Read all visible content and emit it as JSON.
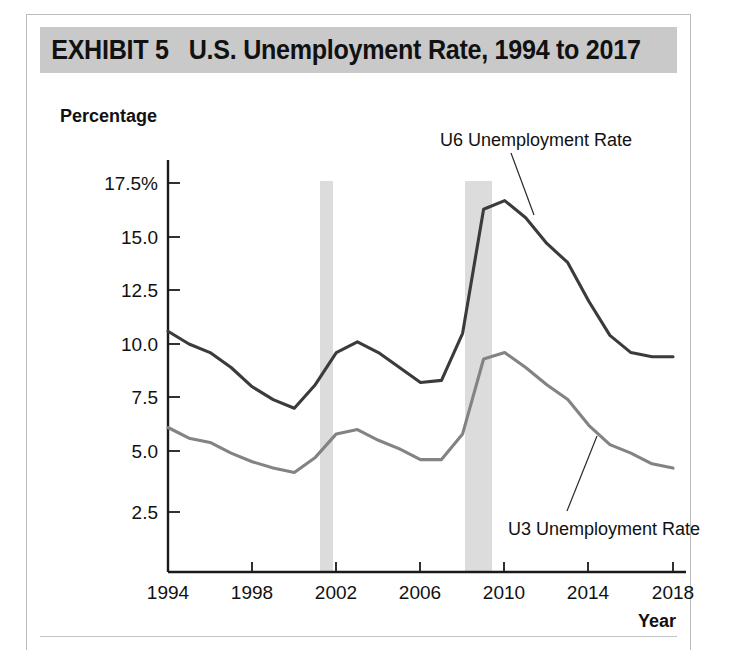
{
  "exhibit": {
    "title": "EXHIBIT 5   U.S. Unemployment Rate, 1994 to 2017",
    "title_bar_color": "#c9c9c9"
  },
  "chart_data": {
    "type": "line",
    "title": "U.S. Unemployment Rate, 1994 to 2017",
    "xlabel": "Year",
    "ylabel": "Percentage",
    "xlim": [
      1994,
      2018
    ],
    "ylim": [
      0,
      18.5
    ],
    "grid": false,
    "legend_position": "inline-annotation",
    "xticks": [
      "1994",
      "1998",
      "2002",
      "2006",
      "2010",
      "2014",
      "2018"
    ],
    "yticks": [
      "2.5",
      "5.0",
      "7.5",
      "10.0",
      "12.5",
      "15.0",
      "17.5%"
    ],
    "ytick_values": [
      2.5,
      5.0,
      7.5,
      10.0,
      12.5,
      15.0,
      17.5
    ],
    "x": [
      1994,
      1995,
      1996,
      1997,
      1998,
      1999,
      2000,
      2001,
      2002,
      2003,
      2004,
      2005,
      2006,
      2007,
      2008,
      2009,
      2010,
      2011,
      2012,
      2013,
      2014,
      2015,
      2016,
      2017,
      2018
    ],
    "series": [
      {
        "name": "U6 Unemployment Rate",
        "color": "#3b3b3b",
        "values": [
          10.6,
          10.0,
          9.6,
          8.9,
          8.0,
          7.4,
          7.0,
          8.1,
          9.6,
          10.1,
          9.6,
          8.9,
          8.2,
          8.3,
          10.5,
          16.3,
          16.7,
          15.9,
          14.7,
          13.8,
          12.0,
          10.4,
          9.6,
          9.4,
          9.4
        ]
      },
      {
        "name": "U3 Unemployment Rate",
        "color": "#838383",
        "values": [
          6.1,
          5.6,
          5.4,
          4.9,
          4.5,
          4.2,
          4.0,
          4.7,
          5.8,
          6.0,
          5.5,
          5.1,
          4.6,
          4.6,
          5.8,
          9.3,
          9.6,
          8.9,
          8.1,
          7.4,
          6.2,
          5.3,
          4.9,
          4.4,
          4.2
        ]
      }
    ],
    "recession_bands": [
      {
        "start": 2001.2,
        "end": 2001.8
      },
      {
        "start": 2007.9,
        "end": 2009.2
      }
    ],
    "annotations": [
      {
        "name": "u6-annotation",
        "text": "U6 Unemployment Rate"
      },
      {
        "name": "u3-annotation",
        "text": "U3 Unemployment Rate"
      }
    ]
  }
}
